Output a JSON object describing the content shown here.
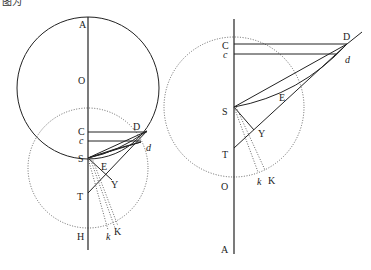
{
  "caption": "图为",
  "figures": [
    {
      "id": "left",
      "labels": {
        "A": "A",
        "O": "O",
        "C": "C",
        "c": "c",
        "D": "D",
        "d": "d",
        "S": "S",
        "E": "E",
        "Y": "Y",
        "T": "T",
        "H": "H",
        "k": "k",
        "K": "K"
      }
    },
    {
      "id": "right",
      "labels": {
        "C": "C",
        "c": "c",
        "D": "D",
        "d": "d",
        "S": "S",
        "E": "E",
        "Y": "Y",
        "T": "T",
        "O": "O",
        "k": "k",
        "K": "K",
        "A": "A"
      }
    }
  ]
}
